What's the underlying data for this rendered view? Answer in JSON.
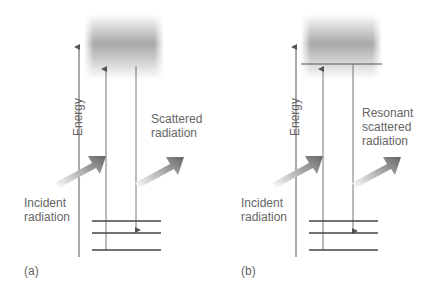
{
  "panels": [
    {
      "id": "a",
      "label": "(a)",
      "axis_label": "Energy",
      "incident_label_line1": "Incident",
      "incident_label_line2": "radiation",
      "scattered_label_line1": "Scattered",
      "scattered_label_line2": "radiation",
      "scattered_label_line3": ""
    },
    {
      "id": "b",
      "label": "(b)",
      "axis_label": "Energy",
      "incident_label_line1": "Incident",
      "incident_label_line2": "radiation",
      "scattered_label_line1": "Resonant",
      "scattered_label_line2": "scattered",
      "scattered_label_line3": "radiation"
    }
  ],
  "colors": {
    "lines": "#555555",
    "band_dark": "#a8a8a8",
    "arrow_dark": "#666666"
  }
}
